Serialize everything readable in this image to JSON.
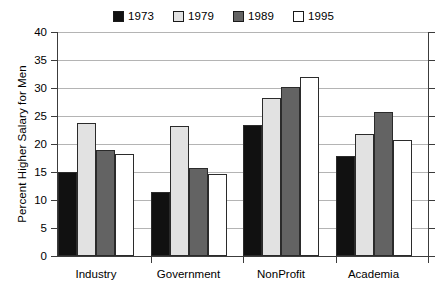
{
  "chart_data": {
    "type": "bar",
    "title": "",
    "subtitle": "",
    "xlabel": "",
    "ylabel": "Percent Higher Salary for Men",
    "ylim": [
      0,
      40
    ],
    "yticks": [
      0,
      5,
      10,
      15,
      20,
      25,
      30,
      35,
      40
    ],
    "ytick_labels": [
      "0",
      "5",
      "10",
      "15",
      "20",
      "25",
      "30",
      "35",
      "40"
    ],
    "grid": true,
    "legend_position": "top-center",
    "categories": [
      "Industry",
      "Government",
      "NonProfit",
      "Academia"
    ],
    "series": [
      {
        "name": "1973",
        "color": "#111111",
        "values": [
          15.0,
          11.5,
          23.4,
          17.8
        ]
      },
      {
        "name": "1979",
        "color": "#e2e2e2",
        "values": [
          23.8,
          23.2,
          28.2,
          21.8
        ]
      },
      {
        "name": "1989",
        "color": "#636363",
        "values": [
          19.0,
          15.7,
          30.2,
          25.7
        ]
      },
      {
        "name": "1995",
        "color": "#ffffff",
        "values": [
          18.2,
          14.7,
          32.0,
          20.8
        ]
      }
    ],
    "annotations": []
  },
  "legend": {
    "entries": [
      {
        "label": "1973"
      },
      {
        "label": "1979"
      },
      {
        "label": "1989"
      },
      {
        "label": "1995"
      }
    ]
  },
  "colors": {
    "axis": "#3c3c3c",
    "grid": "#b4b4b4",
    "bar_outline": "#2b2b2b",
    "background": "#ffffff"
  }
}
